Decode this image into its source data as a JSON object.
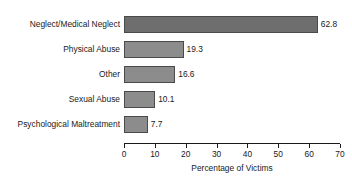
{
  "chart_data": {
    "type": "bar",
    "orientation": "horizontal",
    "title": "",
    "xlabel": "Percentage of Victims",
    "ylabel": "",
    "categories": [
      "Neglect/Medical Neglect",
      "Physical Abuse",
      "Other",
      "Sexual Abuse",
      "Psychological Maltreatment"
    ],
    "values": [
      62.8,
      19.3,
      16.6,
      10.1,
      7.7
    ],
    "value_labels": [
      "62.8",
      "19.3",
      "16.6",
      "10.1",
      "7.7"
    ],
    "xlim": [
      0,
      70
    ],
    "xticks": [
      0,
      10,
      20,
      30,
      40,
      50,
      60,
      70
    ],
    "xtick_labels": [
      "0",
      "10",
      "20",
      "30",
      "40",
      "50",
      "60",
      "70"
    ],
    "grid": false,
    "legend": false,
    "bar_colors": [
      "#6e6e6e",
      "#8c8c8c",
      "#8c8c8c",
      "#8c8c8c",
      "#8c8c8c"
    ],
    "bar_edge_color": "#4a4a4a",
    "axis_color": "#1a1a1a",
    "background": "#ffffff"
  }
}
